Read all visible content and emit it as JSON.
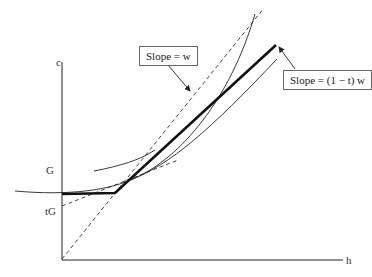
{
  "axes": {
    "y_label": "c",
    "x_label": "h"
  },
  "y_ticks": {
    "g": "G",
    "tg": "tG"
  },
  "annotations": {
    "slope_w": "Slope = w",
    "slope_net": "Slope = (1 − t) w"
  },
  "colors": {
    "line": "#111111",
    "thin_curve": "#222222",
    "dashed": "#333333",
    "box_border": "#666666"
  }
}
